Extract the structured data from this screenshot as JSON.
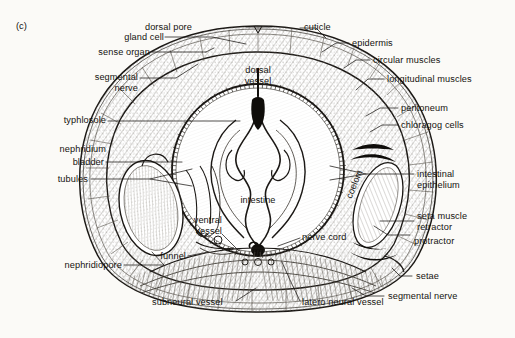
{
  "figure": {
    "panel_id": "(c)",
    "background_color": "#fbfaf7",
    "ink_color": "#15130f",
    "caption_note": "Transverse section of earthworm body"
  },
  "labels": {
    "dorsal_pore": "dorsal pore",
    "gland_cell": "gland cell",
    "sense_organ": "sense organ",
    "segmental_nerve_left_1": "segmental",
    "segmental_nerve_left_2": "nerve",
    "typhlosole": "typhlosole",
    "nephridium": "nephridium",
    "bladder": "bladder",
    "tubules": "tubules",
    "nephridiopore": "nephridiopore",
    "funnel": "funnel",
    "subneural_vessel": "subneural vessel",
    "latero_neural_vessel": "latero neural vessel",
    "cuticle": "cuticle",
    "epidermis": "epidermis",
    "circular_muscles": "circular muscles",
    "longitudinal_muscles": "longitudinal muscles",
    "peritoneum": "peritoneum",
    "chloragog_cells": "chloragog cells",
    "intestinal_epithelium_1": "intestinal",
    "intestinal_epithelium_2": "epithelium",
    "seta_muscle_1": "seta muscle",
    "seta_muscle_2": "retractor",
    "protractor": "protractor",
    "setae": "setae",
    "segmental_nerve_right": "segmental nerve",
    "dorsal_vessel_1": "dorsal",
    "dorsal_vessel_2": "vessel",
    "intestine": "intestine",
    "coelom": "coelom",
    "ventral_vessel_1": "ventral",
    "ventral_vessel_2": "vessel",
    "nerve_cord": "nerve cord"
  }
}
